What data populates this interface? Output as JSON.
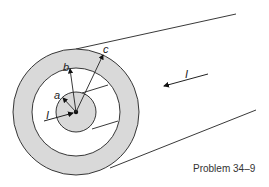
{
  "figure": {
    "caption": "Problem 34–9",
    "labels": {
      "a": "a",
      "b": "b",
      "c": "c",
      "current_front": "I",
      "current_back": "I"
    },
    "colors": {
      "shell": "#d9d9d9",
      "stroke": "#222222",
      "background": "#ffffff"
    },
    "geometry": {
      "center": [
        76,
        112
      ],
      "r_inner": 20,
      "r_middle": 44,
      "r_outer": 63
    }
  }
}
